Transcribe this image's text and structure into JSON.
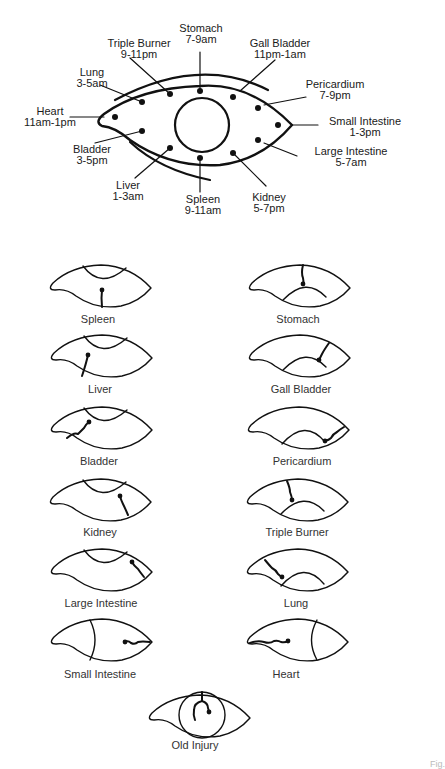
{
  "main_diagram": {
    "title": "Iris meridian clock",
    "organs": [
      {
        "name": "Stomach",
        "time": "7-9am"
      },
      {
        "name": "Triple Burner",
        "time": "9-11pm"
      },
      {
        "name": "Gall Bladder",
        "time": "11pm-1am"
      },
      {
        "name": "Lung",
        "time": "3-5am"
      },
      {
        "name": "Pericardium",
        "time": "7-9pm"
      },
      {
        "name": "Heart",
        "time": "11am-1pm"
      },
      {
        "name": "Small Intestine",
        "time": "1-3pm"
      },
      {
        "name": "Bladder",
        "time": "3-5pm"
      },
      {
        "name": "Large Intestine",
        "time": "5-7am"
      },
      {
        "name": "Liver",
        "time": "1-3am"
      },
      {
        "name": "Spleen",
        "time": "9-11am"
      },
      {
        "name": "Kidney",
        "time": "5-7pm"
      }
    ]
  },
  "small_diagrams": [
    {
      "label": "Spleen"
    },
    {
      "label": "Stomach"
    },
    {
      "label": "Liver"
    },
    {
      "label": "Gall Bladder"
    },
    {
      "label": "Bladder"
    },
    {
      "label": "Pericardium"
    },
    {
      "label": "Kidney"
    },
    {
      "label": "Triple Burner"
    },
    {
      "label": "Large Intestine"
    },
    {
      "label": "Lung"
    },
    {
      "label": "Small Intestine"
    },
    {
      "label": "Heart"
    },
    {
      "label": "Old Injury"
    }
  ],
  "figure_caption": "Fig."
}
